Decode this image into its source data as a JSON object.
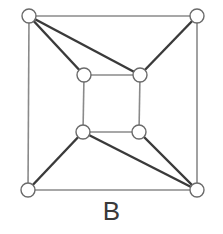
{
  "diagram": {
    "label": "B",
    "type": "graph",
    "nodes": [
      {
        "id": "outer-tl",
        "x": 29,
        "y": 16
      },
      {
        "id": "outer-tr",
        "x": 197,
        "y": 16
      },
      {
        "id": "outer-bl",
        "x": 28,
        "y": 190
      },
      {
        "id": "outer-br",
        "x": 197,
        "y": 190
      },
      {
        "id": "inner-tl",
        "x": 84,
        "y": 75
      },
      {
        "id": "inner-tr",
        "x": 140,
        "y": 75
      },
      {
        "id": "inner-bl",
        "x": 83,
        "y": 132
      },
      {
        "id": "inner-br",
        "x": 139,
        "y": 132
      }
    ],
    "edges": [
      {
        "from": "outer-tl",
        "to": "outer-tr",
        "kind": "outer"
      },
      {
        "from": "outer-tr",
        "to": "outer-br",
        "kind": "outer"
      },
      {
        "from": "outer-br",
        "to": "outer-bl",
        "kind": "outer"
      },
      {
        "from": "outer-bl",
        "to": "outer-tl",
        "kind": "outer"
      },
      {
        "from": "inner-tl",
        "to": "inner-tr",
        "kind": "inner"
      },
      {
        "from": "inner-tr",
        "to": "inner-br",
        "kind": "inner"
      },
      {
        "from": "inner-br",
        "to": "inner-bl",
        "kind": "inner"
      },
      {
        "from": "inner-bl",
        "to": "inner-tl",
        "kind": "inner"
      },
      {
        "from": "outer-tl",
        "to": "inner-tl",
        "kind": "spoke"
      },
      {
        "from": "outer-tl",
        "to": "inner-tr",
        "kind": "spoke"
      },
      {
        "from": "outer-tr",
        "to": "inner-tr",
        "kind": "spoke"
      },
      {
        "from": "outer-bl",
        "to": "inner-bl",
        "kind": "spoke"
      },
      {
        "from": "outer-br",
        "to": "inner-bl",
        "kind": "spoke"
      },
      {
        "from": "outer-br",
        "to": "inner-br",
        "kind": "spoke"
      }
    ],
    "node_radius": 7,
    "colors": {
      "background": "#ffffff",
      "outer_edge": "#8a8a8a",
      "spoke_edge": "#3a3a3a",
      "node_stroke": "#6a6a6a",
      "node_fill": "#ffffff",
      "label": "#3a3a3a"
    }
  }
}
